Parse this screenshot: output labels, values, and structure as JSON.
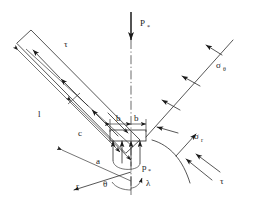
{
  "figure": {
    "type": "engineering-mechanics-diagram",
    "canvas": {
      "width": 253,
      "height": 200
    },
    "line_color": "#2b2b2b",
    "text_color": "#1a1a1a",
    "background": "#ffffff"
  },
  "labels": {
    "applied_load": {
      "symbol": "P",
      "subscript": "*",
      "x": 140,
      "y": 22
    },
    "reaction_pressure": {
      "symbol": "p",
      "subscript": "*",
      "x": 142,
      "y": 170
    },
    "hoop_stress": {
      "symbol": "σ",
      "subscript": "θ",
      "x": 218,
      "y": 68
    },
    "radial_stress": {
      "symbol": "σ",
      "subscript": "r",
      "x": 195,
      "y": 139
    },
    "shear_stress_right": {
      "symbol": "τ",
      "subscript": "",
      "x": 222,
      "y": 183
    },
    "shear_stress_left": {
      "symbol": "τ",
      "subscript": "",
      "x": 66,
      "y": 46
    },
    "length_l": {
      "symbol": "l",
      "subscript": "",
      "x": 39,
      "y": 116
    },
    "length_c": {
      "symbol": "c",
      "subscript": "",
      "x": 80,
      "y": 135
    },
    "length_a": {
      "symbol": "a",
      "subscript": "",
      "x": 98,
      "y": 163
    },
    "half_width_left": {
      "symbol": "b",
      "subscript": "",
      "x": 114,
      "y": 121
    },
    "half_width_right": {
      "symbol": "b",
      "subscript": "",
      "x": 130,
      "y": 121
    },
    "angle_theta": {
      "symbol": "θ",
      "subscript": "",
      "x": 105,
      "y": 184
    },
    "angle_lambda": {
      "symbol": "λ",
      "subscript": "",
      "x": 147,
      "y": 184
    },
    "radial_axis_r": {
      "symbol": "r",
      "subscript": "",
      "x": 78,
      "y": 186
    }
  },
  "annotations": {
    "load_axis": "vertical dash-dot centerline through P*",
    "strut": "inclined elongated rectangular bar at upper left",
    "wedge_face": "inclined straight line to upper right carrying sigma-theta arrows",
    "curved_face": "curved arc at lower right carrying sigma-r and tau arrows",
    "bearing_block": "small rectangle of total width 2b at the apex",
    "pressure_arrows": "upward arrows beneath the bearing block representing p*"
  }
}
